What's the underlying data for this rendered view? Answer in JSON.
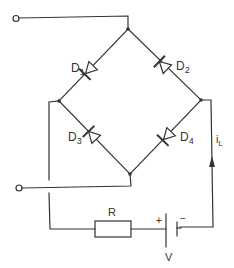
{
  "diagram": {
    "type": "bridge rectifier circuit",
    "components": {
      "diodes": [
        {
          "id": "D1",
          "label": "D",
          "sub": "1"
        },
        {
          "id": "D2",
          "label": "D",
          "sub": "2"
        },
        {
          "id": "D3",
          "label": "D",
          "sub": "3"
        },
        {
          "id": "D4",
          "label": "D",
          "sub": "4"
        }
      ],
      "resistor": {
        "label": "R"
      },
      "battery": {
        "label": "V",
        "plus": "+",
        "minus": "−"
      },
      "current": {
        "label": "i",
        "sub": "L"
      }
    },
    "terminals": [
      "input-top",
      "input-bottom"
    ],
    "colors": {
      "line": "#333333",
      "background": "#ffffff"
    }
  }
}
